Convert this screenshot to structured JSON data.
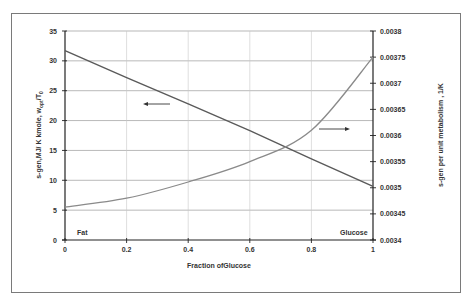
{
  "chart_data": {
    "type": "line",
    "title": "",
    "xlabel": "Fraction ofGlucose",
    "ylabel": "s-gen,MJ/ K kmole, w_opt/T0",
    "ylabel_main": "s-gen,MJ/ K kmole, w",
    "ylabel_sub": "opt",
    "ylabel_tail": "/T",
    "ylabel_sub2": "0",
    "y2label": "s-gen per unit metabolism , 1/K",
    "xlim": [
      0,
      1
    ],
    "ylim": [
      0,
      35
    ],
    "y2lim": [
      0.0034,
      0.0038
    ],
    "x_ticks": [
      "0",
      "0.2",
      "0.4",
      "0.6",
      "0.8",
      "1"
    ],
    "y_ticks": [
      "0",
      "5",
      "10",
      "15",
      "20",
      "25",
      "30",
      "35"
    ],
    "y2_ticks": [
      "0.0034",
      "0.00345",
      "0.0035",
      "0.00355",
      "0.0036",
      "0.00365",
      "0.0037",
      "0.00375",
      "0.0038"
    ],
    "grid": true,
    "legend": "none",
    "annotations": [
      {
        "text": "Fat",
        "position": "bottom-left"
      },
      {
        "text": "Glucose",
        "position": "bottom-right"
      },
      {
        "text": "left arrow",
        "meaning": "decreasing line reads on left axis"
      },
      {
        "text": "right arrow",
        "meaning": "increasing curve reads on right axis"
      }
    ],
    "x": [
      0,
      0.2,
      0.4,
      0.6,
      0.8,
      1.0
    ],
    "series": [
      {
        "name": "s-gen, MJ/K kmole (w_opt/T0)",
        "axis": "left",
        "color": "#5a5a5a",
        "values": [
          31.7,
          27.2,
          22.8,
          18.3,
          13.6,
          9.0
        ]
      },
      {
        "name": "s-gen per unit metabolism, 1/K",
        "axis": "right",
        "color": "#8a8a8a",
        "values": [
          0.003463,
          0.00348,
          0.003511,
          0.00355,
          0.00361,
          0.00375
        ]
      }
    ]
  },
  "labels": {
    "fat": "Fat",
    "glucose": "Glucose"
  }
}
